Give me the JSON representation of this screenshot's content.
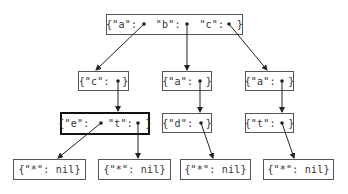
{
  "diagram": {
    "type": "trie",
    "nodes": [
      {
        "id": "root",
        "label": "{\"a\":   \"b\":   \"c\":  }",
        "x": 106,
        "y": 14,
        "w": 137,
        "h": 21,
        "bold": false
      },
      {
        "id": "c",
        "label": "{\"c\":  }",
        "x": 78,
        "y": 71,
        "w": 51,
        "h": 20,
        "bold": false
      },
      {
        "id": "ba",
        "label": "{\"a\":  }",
        "x": 162,
        "y": 71,
        "w": 50,
        "h": 20,
        "bold": false
      },
      {
        "id": "ca",
        "label": "{\"a\":  }",
        "x": 245,
        "y": 71,
        "w": 49,
        "h": 20,
        "bold": false
      },
      {
        "id": "cet",
        "label": "{\"e\":   \"t\":  }",
        "x": 60,
        "y": 112,
        "w": 90,
        "h": 23,
        "bold": true
      },
      {
        "id": "bad",
        "label": "{\"d\":  }",
        "x": 162,
        "y": 113,
        "w": 50,
        "h": 20,
        "bold": false
      },
      {
        "id": "cat",
        "label": "{\"t\":  }",
        "x": 245,
        "y": 113,
        "w": 49,
        "h": 20,
        "bold": false
      },
      {
        "id": "leaf1",
        "label": "{\"*\": nil}",
        "x": 13,
        "y": 159,
        "w": 73,
        "h": 21,
        "bold": false
      },
      {
        "id": "leaf2",
        "label": "{\"*\": nil}",
        "x": 98,
        "y": 159,
        "w": 73,
        "h": 21,
        "bold": false
      },
      {
        "id": "leaf3",
        "label": "{\"*\": nil}",
        "x": 180,
        "y": 159,
        "w": 71,
        "h": 21,
        "bold": false
      },
      {
        "id": "leaf4",
        "label": "{\"*\": nil}",
        "x": 263,
        "y": 159,
        "w": 71,
        "h": 21,
        "bold": false
      }
    ],
    "edges": [
      {
        "from": "root",
        "key": "a",
        "to": "c",
        "x1": 144,
        "y1": 24,
        "x2": 96,
        "y2": 70
      },
      {
        "from": "root",
        "key": "b",
        "to": "ba",
        "x1": 187,
        "y1": 24,
        "x2": 187,
        "y2": 70
      },
      {
        "from": "root",
        "key": "c",
        "to": "ca",
        "x1": 229,
        "y1": 24,
        "x2": 267,
        "y2": 70
      },
      {
        "from": "c",
        "key": "c",
        "to": "cet",
        "x1": 118,
        "y1": 81,
        "x2": 118,
        "y2": 111
      },
      {
        "from": "ba",
        "key": "a",
        "to": "bad",
        "x1": 200,
        "y1": 81,
        "x2": 200,
        "y2": 112
      },
      {
        "from": "ca",
        "key": "a",
        "to": "cat",
        "x1": 282,
        "y1": 81,
        "x2": 282,
        "y2": 112
      },
      {
        "from": "cet",
        "key": "e",
        "to": "leaf1",
        "x1": 101,
        "y1": 123,
        "x2": 58,
        "y2": 158
      },
      {
        "from": "cet",
        "key": "t",
        "to": "leaf2",
        "x1": 138,
        "y1": 123,
        "x2": 138,
        "y2": 158
      },
      {
        "from": "bad",
        "key": "d",
        "to": "leaf3",
        "x1": 201,
        "y1": 123,
        "x2": 213,
        "y2": 158
      },
      {
        "from": "cat",
        "key": "t",
        "to": "leaf4",
        "x1": 282,
        "y1": 123,
        "x2": 294,
        "y2": 158
      }
    ],
    "colors": {
      "border": "#555555",
      "bold_border": "#111111",
      "text": "#333333",
      "edge": "#222222"
    }
  }
}
